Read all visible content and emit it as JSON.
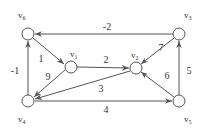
{
  "diagram": {
    "type": "weighted directed graph",
    "nodes": [
      {
        "id": "v1",
        "label": "v",
        "sub": "1",
        "x": 71,
        "y": 67
      },
      {
        "id": "v2",
        "label": "v",
        "sub": "2",
        "x": 136,
        "y": 68
      },
      {
        "id": "v3",
        "label": "v",
        "sub": "3",
        "x": 179,
        "y": 34
      },
      {
        "id": "v4",
        "label": "v",
        "sub": "4",
        "x": 28,
        "y": 101
      },
      {
        "id": "v5",
        "label": "v",
        "sub": "5",
        "x": 179,
        "y": 101
      },
      {
        "id": "v6",
        "label": "v",
        "sub": "6",
        "x": 28,
        "y": 34
      }
    ],
    "edges": [
      {
        "from": "v3",
        "to": "v6",
        "weight": "-2"
      },
      {
        "from": "v6",
        "to": "v1",
        "weight": "1"
      },
      {
        "from": "v1",
        "to": "v2",
        "weight": "2"
      },
      {
        "from": "v1",
        "to": "v4",
        "weight": "9"
      },
      {
        "from": "v4",
        "to": "v6",
        "weight": "-1"
      },
      {
        "from": "v2",
        "to": "v4",
        "weight": "3"
      },
      {
        "from": "v4",
        "to": "v5",
        "weight": "4"
      },
      {
        "from": "v5",
        "to": "v3",
        "weight": "5"
      },
      {
        "from": "v5",
        "to": "v2",
        "weight": "6"
      },
      {
        "from": "v3",
        "to": "v2",
        "weight": "7"
      }
    ]
  }
}
